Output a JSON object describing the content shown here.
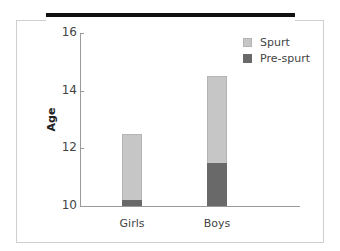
{
  "chart_data": {
    "type": "bar",
    "stacked": true,
    "title": "",
    "xlabel": "",
    "ylabel": "Age",
    "ylim": [
      10,
      16
    ],
    "yticks": [
      10,
      12,
      14,
      16
    ],
    "categories": [
      "Girls",
      "Boys"
    ],
    "series": [
      {
        "name": "Pre-spurt",
        "color": "#696969",
        "values": [
          10.2,
          11.5
        ]
      },
      {
        "name": "Spurt",
        "color": "#c6c6c6",
        "values": [
          12.5,
          14.5
        ]
      }
    ],
    "series_note": "Spurt values are the top of each stacked bar (age at end of spurt); Pre-spurt values are top of dark segment",
    "legend": {
      "position": "top-right",
      "entries": [
        "Spurt",
        "Pre-spurt"
      ]
    },
    "grid": false
  },
  "axis": {
    "y_title": "Age",
    "ticks": [
      {
        "label": "16",
        "value": 16
      },
      {
        "label": "14",
        "value": 14
      },
      {
        "label": "12",
        "value": 12
      },
      {
        "label": "10",
        "value": 10
      }
    ]
  },
  "categories": [
    {
      "label": "Girls",
      "pre": 10.2,
      "total": 12.5
    },
    {
      "label": "Boys",
      "pre": 11.5,
      "total": 14.5
    }
  ],
  "legend": [
    {
      "label": "Spurt",
      "color": "#c6c6c6"
    },
    {
      "label": "Pre-spurt",
      "color": "#696969"
    }
  ]
}
